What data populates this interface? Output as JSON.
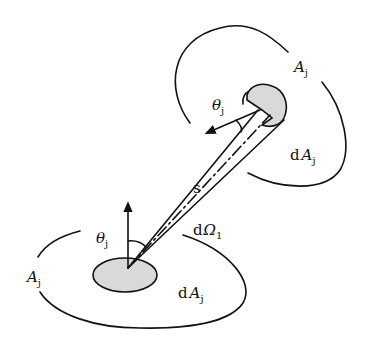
{
  "diagram": {
    "type": "radiative view factor between two surfaces",
    "labels": {
      "top_surface": {
        "main": "A",
        "sub": "j"
      },
      "top_angle": {
        "main": "θ",
        "sub": "j"
      },
      "top_element": {
        "prefix": "d",
        "main": "A",
        "sub": "j"
      },
      "distance": "s",
      "solid_angle": {
        "prefix": "d",
        "main": "Ω",
        "sub": "1"
      },
      "bottom_angle": {
        "main": "θ",
        "sub": "j"
      },
      "bottom_surface": {
        "main": "A",
        "sub": "j"
      },
      "bottom_element": {
        "prefix": "d",
        "main": "A",
        "sub": "j"
      }
    },
    "colors": {
      "line": "#111111",
      "patch_fill": "#d9d9d9",
      "background": "#ffffff"
    }
  }
}
